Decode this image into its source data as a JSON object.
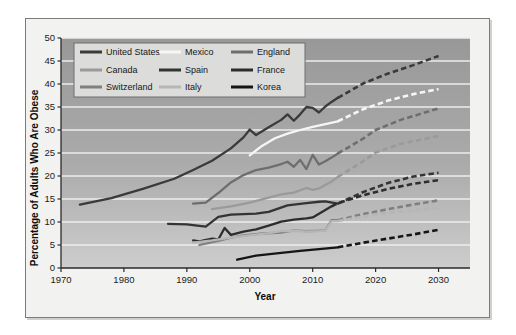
{
  "chart_data": {
    "type": "line",
    "title": "",
    "xlabel": "Year",
    "ylabel": "Percentage of Adults Who Are Obese",
    "xlim": [
      1970,
      2035
    ],
    "ylim": [
      0,
      50
    ],
    "xticks": [
      1970,
      1980,
      1990,
      2000,
      2010,
      2020,
      2030
    ],
    "yticks": [
      0,
      5,
      10,
      15,
      20,
      25,
      30,
      35,
      40,
      45,
      50
    ],
    "grid": "horizontal",
    "legend_position": "top-left-inside",
    "note_projection": "dashed segments are projections",
    "series": [
      {
        "name": "United States",
        "color": "#3a3a3a",
        "observed": [
          [
            1973,
            13.8
          ],
          [
            1978,
            15.2
          ],
          [
            1983,
            17.2
          ],
          [
            1988,
            19.4
          ],
          [
            1991,
            21.3
          ],
          [
            1994,
            23.3
          ],
          [
            1997,
            26.0
          ],
          [
            1999,
            28.4
          ],
          [
            2000,
            30.1
          ],
          [
            2001,
            28.9
          ],
          [
            2003,
            30.6
          ],
          [
            2005,
            32.2
          ],
          [
            2006,
            33.4
          ],
          [
            2007,
            32.0
          ],
          [
            2008,
            33.4
          ],
          [
            2009,
            35.0
          ],
          [
            2010,
            34.8
          ],
          [
            2011,
            33.8
          ],
          [
            2012,
            35.1
          ],
          [
            2013,
            36.1
          ],
          [
            2014,
            37.0
          ]
        ],
        "projected": [
          [
            2014,
            37.0
          ],
          [
            2018,
            40.1
          ],
          [
            2022,
            42.3
          ],
          [
            2026,
            44.1
          ],
          [
            2030,
            46.1
          ]
        ]
      },
      {
        "name": "Mexico",
        "color": "#f6f6f4",
        "observed": [
          [
            2000,
            24.5
          ],
          [
            2002,
            26.6
          ],
          [
            2004,
            28.2
          ],
          [
            2006,
            29.2
          ],
          [
            2008,
            30.0
          ],
          [
            2010,
            30.7
          ],
          [
            2012,
            31.3
          ],
          [
            2014,
            31.9
          ]
        ],
        "projected": [
          [
            2014,
            31.9
          ],
          [
            2018,
            34.5
          ],
          [
            2022,
            36.4
          ],
          [
            2026,
            37.8
          ],
          [
            2030,
            38.9
          ]
        ]
      },
      {
        "name": "England",
        "color": "#6e6e6e",
        "observed": [
          [
            1991,
            14.0
          ],
          [
            1993,
            14.2
          ],
          [
            1995,
            16.3
          ],
          [
            1997,
            18.6
          ],
          [
            1999,
            20.2
          ],
          [
            2001,
            21.3
          ],
          [
            2003,
            21.8
          ],
          [
            2005,
            22.6
          ],
          [
            2006,
            23.1
          ],
          [
            2007,
            22.0
          ],
          [
            2008,
            23.5
          ],
          [
            2009,
            21.5
          ],
          [
            2010,
            24.6
          ],
          [
            2011,
            22.5
          ],
          [
            2012,
            23.2
          ],
          [
            2013,
            24.0
          ],
          [
            2014,
            24.9
          ]
        ],
        "projected": [
          [
            2014,
            24.9
          ],
          [
            2018,
            28.1
          ],
          [
            2020,
            30.0
          ],
          [
            2024,
            32.2
          ],
          [
            2030,
            34.7
          ]
        ]
      },
      {
        "name": "Canada",
        "color": "#9a9a9a",
        "observed": [
          [
            1994,
            12.8
          ],
          [
            1997,
            13.4
          ],
          [
            2000,
            14.2
          ],
          [
            2003,
            15.3
          ],
          [
            2005,
            16.0
          ],
          [
            2007,
            16.4
          ],
          [
            2009,
            17.4
          ],
          [
            2010,
            17.0
          ],
          [
            2011,
            17.3
          ],
          [
            2013,
            18.8
          ],
          [
            2014,
            19.8
          ]
        ],
        "projected": [
          [
            2014,
            19.8
          ],
          [
            2018,
            23.2
          ],
          [
            2020,
            25.1
          ],
          [
            2024,
            27.0
          ],
          [
            2030,
            28.7
          ]
        ]
      },
      {
        "name": "Spain",
        "color": "#343434",
        "observed": [
          [
            1987,
            9.6
          ],
          [
            1990,
            9.5
          ],
          [
            1993,
            9.0
          ],
          [
            1995,
            11.1
          ],
          [
            1997,
            11.6
          ],
          [
            2001,
            11.8
          ],
          [
            2003,
            12.2
          ],
          [
            2006,
            13.6
          ],
          [
            2009,
            14.1
          ],
          [
            2011,
            14.4
          ],
          [
            2012,
            14.5
          ],
          [
            2014,
            14.0
          ]
        ],
        "projected": [
          [
            2014,
            14.0
          ],
          [
            2018,
            16.5
          ],
          [
            2022,
            18.5
          ],
          [
            2026,
            19.9
          ],
          [
            2030,
            20.7
          ]
        ]
      },
      {
        "name": "France",
        "color": "#2d2d2d",
        "observed": [
          [
            1991,
            6.0
          ],
          [
            1992,
            5.8
          ],
          [
            1994,
            6.4
          ],
          [
            1995,
            6.2
          ],
          [
            1996,
            8.7
          ],
          [
            1997,
            7.2
          ],
          [
            1999,
            7.9
          ],
          [
            2001,
            8.4
          ],
          [
            2003,
            9.2
          ],
          [
            2005,
            10.1
          ],
          [
            2007,
            10.5
          ],
          [
            2009,
            10.8
          ],
          [
            2010,
            11.0
          ],
          [
            2012,
            12.6
          ],
          [
            2013,
            13.4
          ]
        ],
        "projected": [
          [
            2013,
            13.4
          ],
          [
            2014,
            14.1
          ],
          [
            2018,
            15.8
          ],
          [
            2022,
            17.2
          ],
          [
            2026,
            18.3
          ],
          [
            2030,
            19.1
          ]
        ]
      },
      {
        "name": "Switzerland",
        "color": "#7f7f7f",
        "observed": [
          [
            1992,
            5.0
          ],
          [
            1995,
            5.9
          ],
          [
            1997,
            6.6
          ],
          [
            1999,
            7.1
          ],
          [
            2002,
            7.5
          ],
          [
            2005,
            7.7
          ],
          [
            2007,
            8.2
          ],
          [
            2009,
            8.0
          ],
          [
            2011,
            8.1
          ],
          [
            2012,
            8.2
          ],
          [
            2013,
            10.4
          ],
          [
            2014,
            10.4
          ]
        ],
        "projected": [
          [
            2014,
            10.4
          ],
          [
            2018,
            11.7
          ],
          [
            2022,
            12.8
          ],
          [
            2026,
            13.8
          ],
          [
            2030,
            14.7
          ]
        ]
      },
      {
        "name": "Italy",
        "color": "#b6b6b6",
        "observed": [
          [
            1991,
            5.5
          ],
          [
            1994,
            6.0
          ],
          [
            1997,
            6.6
          ],
          [
            2000,
            7.1
          ],
          [
            2003,
            7.6
          ],
          [
            2005,
            8.0
          ],
          [
            2007,
            8.1
          ],
          [
            2009,
            7.9
          ],
          [
            2011,
            8.0
          ],
          [
            2012,
            8.1
          ],
          [
            2013,
            10.2
          ],
          [
            2014,
            10.2
          ]
        ],
        "projected": [
          [
            2014,
            10.2
          ],
          [
            2018,
            11.2
          ],
          [
            2022,
            12.0
          ],
          [
            2026,
            12.6
          ],
          [
            2030,
            13.0
          ]
        ]
      },
      {
        "name": "Korea",
        "color": "#151515",
        "observed": [
          [
            1998,
            1.8
          ],
          [
            2001,
            2.7
          ],
          [
            2005,
            3.3
          ],
          [
            2008,
            3.7
          ],
          [
            2011,
            4.1
          ],
          [
            2014,
            4.5
          ]
        ],
        "projected": [
          [
            2014,
            4.5
          ],
          [
            2018,
            5.5
          ],
          [
            2022,
            6.4
          ],
          [
            2026,
            7.3
          ],
          [
            2030,
            8.3
          ]
        ]
      }
    ],
    "legend": [
      {
        "label": "United States",
        "color": "#3a3a3a"
      },
      {
        "label": "Mexico",
        "color": "#f6f6f4"
      },
      {
        "label": "England",
        "color": "#6e6e6e"
      },
      {
        "label": "Canada",
        "color": "#9a9a9a"
      },
      {
        "label": "Spain",
        "color": "#343434"
      },
      {
        "label": "France",
        "color": "#2d2d2d"
      },
      {
        "label": "Switzerland",
        "color": "#7f7f7f"
      },
      {
        "label": "Italy",
        "color": "#b6b6b6"
      },
      {
        "label": "Korea",
        "color": "#151515"
      }
    ]
  },
  "style": {
    "plot_bg_top": "#9a9a9a",
    "plot_bg_bottom": "#c9c9c9",
    "figure_bg": "#f2f2f0",
    "gridline_color": "#ececec",
    "axis_color": "#2a2a2a",
    "legend_bg": "#dcdcda",
    "legend_border": "#6f6f6f"
  }
}
